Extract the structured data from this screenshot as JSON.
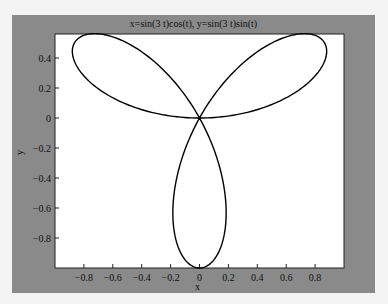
{
  "chart_data": {
    "type": "line",
    "title": "x=sin(3 t)cos(t), y=sin(3 t)sin(t)",
    "xlabel": "x",
    "ylabel": "y",
    "xlim": [
      -1.0,
      1.0
    ],
    "ylim": [
      -1.0,
      0.56
    ],
    "x_ticks": [
      -0.8,
      -0.6,
      -0.4,
      -0.2,
      0,
      0.2,
      0.4,
      0.6,
      0.8
    ],
    "x_tick_labels": [
      "−0.8",
      "−0.6",
      "−0.4",
      "−0.2",
      "0",
      "0.2",
      "0.4",
      "0.6",
      "0.8"
    ],
    "y_ticks": [
      0.4,
      0.2,
      0,
      -0.2,
      -0.4,
      -0.6,
      -0.8
    ],
    "y_tick_labels": [
      "0.4",
      "0.2",
      "0",
      "−0.2",
      "−0.4",
      "−0.6",
      "−0.8"
    ],
    "grid": false,
    "legend": null,
    "series": [
      {
        "name": "curve",
        "color": "#000000",
        "curve_source": "Path is computed by sampling the parametric equation shown in the title (x=sin(3t)cos(t), y=sin(3t)sin(t)) for t in [0, pi]. These points are derived from the formula, not measured from the image.",
        "param": {
          "x_expr": "sin(3t)cos(t)",
          "y_expr": "sin(3t)sin(t)",
          "t_min": 0,
          "t_max": 3.14159,
          "samples": 360
        }
      }
    ],
    "observed_estimates": {
      "note": "Approximate values read visually from the screenshot against the tick marks; precision about ±0.03.",
      "petal_count": 3,
      "crossing_point": [
        0,
        0
      ],
      "upper_left_petal": {
        "leftmost_x": -0.88,
        "top_y": 0.56
      },
      "upper_right_petal": {
        "rightmost_x": 0.88,
        "top_y": 0.56
      },
      "bottom_petal": {
        "bottom_y": -1.0,
        "half_width_x": 0.18
      }
    }
  },
  "colors": {
    "figure_background": "#8a8a8a",
    "axes_background": "#ffffff",
    "line": "#000000"
  }
}
